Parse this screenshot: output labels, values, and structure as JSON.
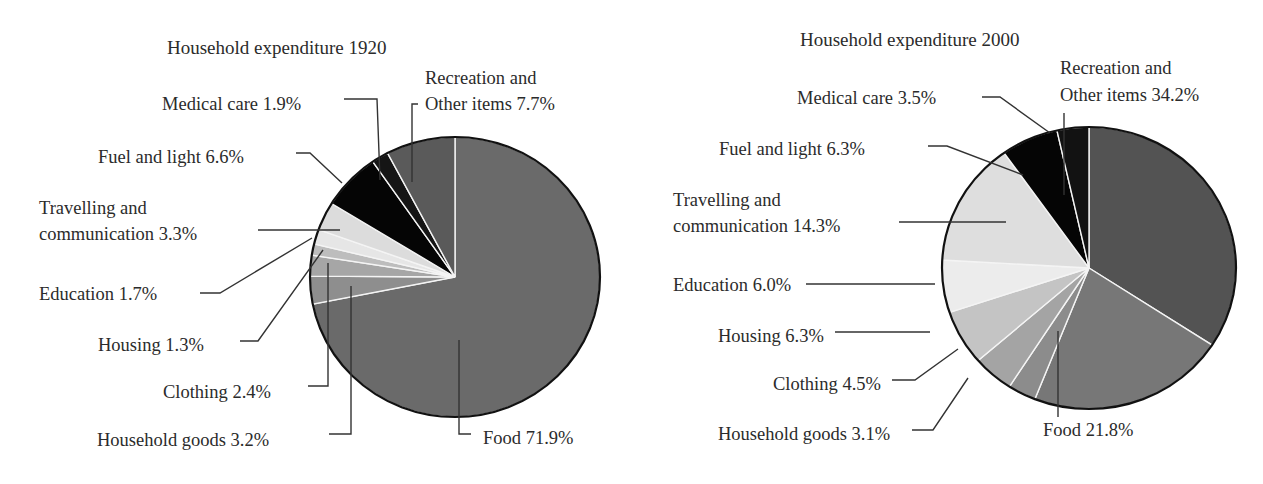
{
  "chart_data": [
    {
      "type": "pie",
      "title": "Household expenditure 1920",
      "start_angle_deg": 0,
      "direction": "clockwise",
      "categories": [
        "Food",
        "Household goods",
        "Clothing",
        "Housing",
        "Education",
        "Travelling and communication",
        "Fuel and light",
        "Medical care",
        "Recreation and Other items"
      ],
      "values": [
        71.9,
        3.2,
        2.4,
        1.3,
        1.7,
        3.3,
        6.6,
        1.9,
        7.7
      ],
      "unit": "%",
      "labels": {
        "food": "Food 71.9%",
        "household_goods": "Household goods 3.2%",
        "clothing": "Clothing 2.4%",
        "housing": "Housing 1.3%",
        "education": "Education 1.7%",
        "travelling_line1": "Travelling and",
        "travelling_line2": "communication 3.3%",
        "fuel": "Fuel and light 6.6%",
        "medical": "Medical care 1.9%",
        "recreation_line1": "Recreation and",
        "recreation_line2": "Other items 7.7%"
      },
      "colors": [
        "#6a6a6a",
        "#8e8e8e",
        "#a6a6a6",
        "#bdbdbd",
        "#e6e6e6",
        "#dcdcdc",
        "#050505",
        "#151515",
        "#5a5a5a"
      ]
    },
    {
      "type": "pie",
      "title": "Household expenditure 2000",
      "start_angle_deg": 0,
      "direction": "clockwise",
      "categories": [
        "Recreation and Other items",
        "Food",
        "Household goods",
        "Clothing",
        "Housing",
        "Education",
        "Travelling and communication",
        "Fuel and light",
        "Medical care"
      ],
      "values": [
        34.2,
        21.8,
        3.1,
        4.5,
        6.3,
        6.0,
        14.3,
        6.3,
        3.5
      ],
      "unit": "%",
      "labels": {
        "recreation_line1": "Recreation and",
        "recreation_line2": "Other items 34.2%",
        "food": "Food 21.8%",
        "household_goods": "Household goods 3.1%",
        "clothing": "Clothing 4.5%",
        "housing": "Housing 6.3%",
        "education": "Education 6.0%",
        "travelling_line1": "Travelling and",
        "travelling_line2": "communication 14.3%",
        "fuel": "Fuel and light 6.3%",
        "medical": "Medical care 3.5%"
      },
      "colors": [
        "#535353",
        "#777777",
        "#8c8c8c",
        "#a4a4a4",
        "#c4c4c4",
        "#ececec",
        "#dedede",
        "#050505",
        "#121212"
      ]
    }
  ]
}
